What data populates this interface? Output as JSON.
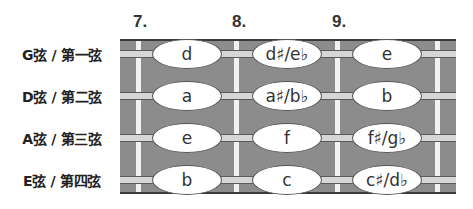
{
  "fret_numbers": [
    "7.",
    "8.",
    "9."
  ],
  "strings": [
    {
      "label": "G弦 / 第一弦",
      "notes": [
        "d",
        "d♯/e♭",
        "e"
      ]
    },
    {
      "label": "D弦 / 第二弦",
      "notes": [
        "a",
        "a♯/b♭",
        "b"
      ]
    },
    {
      "label": "A弦 / 第三弦",
      "notes": [
        "e",
        "f",
        "f♯/g♭"
      ]
    },
    {
      "label": "E弦 / 第四弦",
      "notes": [
        "b",
        "c",
        "c♯/d♭"
      ]
    }
  ],
  "colors": {
    "fretboard": "#8c8c8c",
    "fret": "#f2f2f2",
    "string": "#d6d6d6",
    "note_fill": "#ffffff"
  }
}
